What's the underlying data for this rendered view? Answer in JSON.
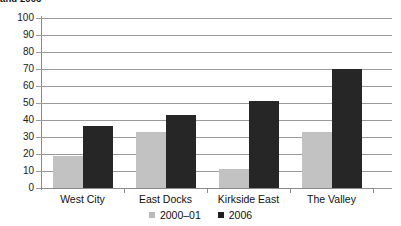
{
  "chart_data": {
    "type": "bar",
    "title": "and 2006",
    "subtitle": "",
    "xlabel": "",
    "ylabel": "",
    "categories": [
      "West City",
      "East Docks",
      "Kirkside East",
      "The Valley"
    ],
    "series": [
      {
        "name": "2000–01",
        "color": "#c2c2c2",
        "values": [
          19,
          33,
          11,
          33
        ]
      },
      {
        "name": "2006",
        "color": "#262626",
        "values": [
          36.5,
          43,
          51,
          70
        ]
      }
    ],
    "ylim": [
      0,
      100
    ],
    "ytick_labels": [
      "0",
      "10",
      "20",
      "30",
      "40",
      "50",
      "60",
      "70",
      "80",
      "90",
      "100"
    ],
    "ytick_values": [
      0,
      10,
      20,
      30,
      40,
      50,
      60,
      70,
      80,
      90,
      100
    ],
    "grid": true,
    "legend_position": "bottom"
  },
  "legend": {
    "items": [
      {
        "label": "2000–01",
        "swatch": "legend-swatch-2000-01"
      },
      {
        "label": "2006",
        "swatch": "legend-swatch-2006"
      }
    ]
  }
}
